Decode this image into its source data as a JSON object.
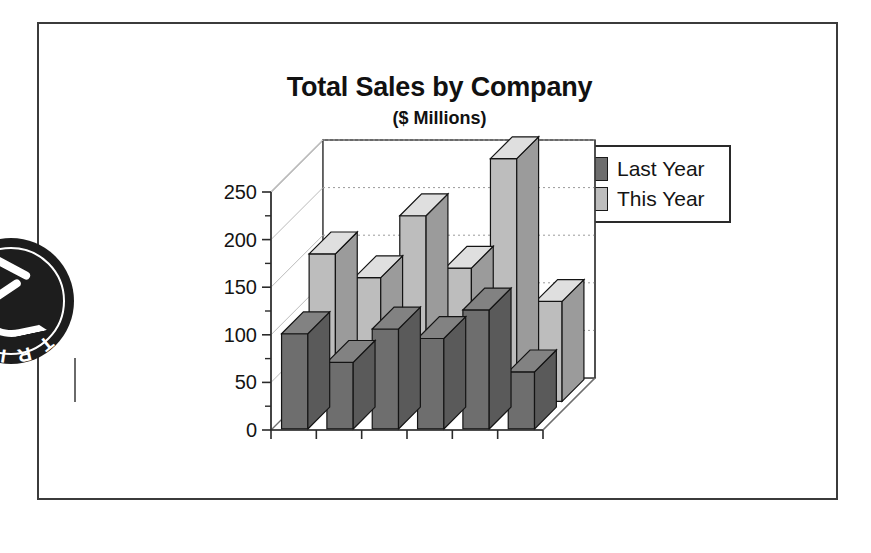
{
  "chart_data": {
    "type": "bar",
    "title": "Total Sales by Company",
    "subtitle": "($ Millions)",
    "xlabel": "",
    "ylabel": "",
    "ylim": [
      0,
      250
    ],
    "yticks": [
      0,
      50,
      100,
      150,
      200,
      250
    ],
    "ytick_labels": [
      "0",
      "50",
      "100",
      "150",
      "200",
      "250"
    ],
    "grid": true,
    "grid_axis": "y",
    "projection": "3d",
    "legend_position": "top-right",
    "categories": [
      "1",
      "2",
      "3",
      "4",
      "5",
      "6"
    ],
    "series": [
      {
        "name": "Last Year",
        "color": "#6e6e6e",
        "values": [
          100,
          70,
          105,
          95,
          125,
          60
        ]
      },
      {
        "name": "This Year",
        "color": "#bdbdbd",
        "values": [
          155,
          130,
          195,
          140,
          255,
          105
        ]
      }
    ]
  },
  "legend": {
    "items": [
      {
        "label": "Last Year",
        "color": "#6e6e6e"
      },
      {
        "label": "This Year",
        "color": "#bdbdbd"
      }
    ]
  },
  "badge": {
    "arc_text_top": "S",
    "arc_text_bottom": "T R I C K"
  }
}
